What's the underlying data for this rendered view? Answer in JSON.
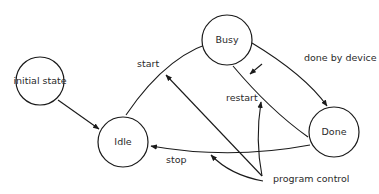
{
  "diagram": {
    "type": "state-transition",
    "states": [
      {
        "id": "initial",
        "label": "initial state"
      },
      {
        "id": "idle",
        "label": "Idle"
      },
      {
        "id": "busy",
        "label": "Busy"
      },
      {
        "id": "done",
        "label": "Done"
      }
    ],
    "transitions": [
      {
        "from": "initial",
        "to": "idle",
        "label": ""
      },
      {
        "from": "idle",
        "to": "busy",
        "label": "start"
      },
      {
        "from": "busy",
        "to": "done",
        "label": "done by device"
      },
      {
        "from": "done",
        "to": "busy",
        "label": "restart"
      },
      {
        "from": "done",
        "to": "idle",
        "label": "stop"
      }
    ],
    "annotation": {
      "label": "program control",
      "points_to": [
        "start",
        "restart",
        "stop"
      ]
    }
  }
}
